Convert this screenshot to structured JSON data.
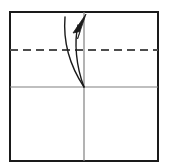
{
  "figure": {
    "canvas": {
      "width": 169,
      "height": 168,
      "background": "#ffffff"
    }
  },
  "colors": {
    "sheet_outline": "#1a1a1a",
    "crease_line": "#808080",
    "fold_line": "#4d4d4d",
    "arrow_stroke": "#1a1a1a",
    "arrow_fill": "#1a1a1a",
    "paper_fill": "#ffffff"
  },
  "sheet": {
    "name": "paper-square",
    "x": 10,
    "y": 12,
    "width": 148,
    "height": 149,
    "stroke_width": 2
  },
  "creases": [
    {
      "name": "vertical-center-crease",
      "orientation": "vertical",
      "x1": 84,
      "y1": 12,
      "x2": 84,
      "y2": 161,
      "style": "solid",
      "stroke_width": 1
    },
    {
      "name": "horizontal-center-crease",
      "orientation": "horizontal",
      "x1": 10,
      "y1": 87,
      "x2": 158,
      "y2": 87,
      "style": "solid",
      "stroke_width": 1
    }
  ],
  "fold_lines": [
    {
      "name": "quarter-fold-dashed-line",
      "orientation": "horizontal",
      "x1": 10,
      "y1": 50,
      "x2": 158,
      "y2": 50,
      "style": "dashed",
      "dash_length": 8,
      "dash_gap": 5,
      "stroke_width": 2
    }
  ],
  "arrow": {
    "name": "fold-direction-arrow",
    "type": "curved-double-stroke",
    "direction": "upward",
    "origin": {
      "x": 84,
      "y": 87
    },
    "tip": {
      "x": 86,
      "y": 14
    },
    "outer_path": "M 84 87 C 70 66, 63 42, 65 17",
    "inner_path": "M 84 87 C 76 66, 74 42, 78 24",
    "head_points": "86,14 74,32 81,31 78,38",
    "stroke_width": 1.4
  }
}
